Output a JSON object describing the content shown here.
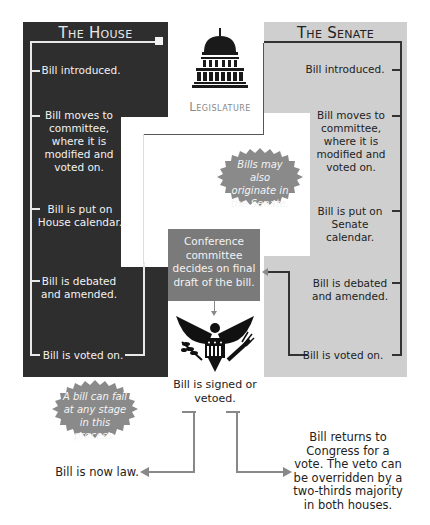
{
  "house": {
    "title": "The House",
    "steps": [
      "Bill introduced.",
      "Bill moves to committee, where it is modified and voted on.",
      "Bill is put on House calendar.",
      "Bill is debated and amended.",
      "Bill is voted on."
    ],
    "color": "#2e2e2e"
  },
  "senate": {
    "title": "The Senate",
    "steps": [
      "Bill introduced.",
      "Bill moves to committee, where it is modified and voted on.",
      "Bill is put on Senate calendar.",
      "Bill is debated and amended.",
      "Bill is voted on."
    ],
    "color": "#cfcfcf"
  },
  "legislature": {
    "label": "Legislature",
    "icon": "capitol-dome-icon"
  },
  "notes": {
    "senate_origin": "Bills may also originate in the Senate.",
    "fail": "A bill can fail at any stage in this process."
  },
  "conference": {
    "label": "Conference committee decides on final draft of the bill.",
    "color": "#7a7a7a"
  },
  "executive": {
    "icon": "presidential-eagle-icon",
    "label": "Bill is signed or vetoed."
  },
  "outcomes": {
    "signed": "Bill is now law.",
    "vetoed": "Bill returns to Congress for a vote. The veto can be overridden by a two-thirds majority in both houses."
  }
}
